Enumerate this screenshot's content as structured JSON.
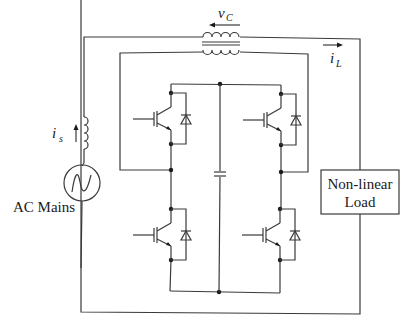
{
  "diagram": {
    "type": "circuit-schematic",
    "labels": {
      "voltage_transformer": "v",
      "voltage_transformer_sub": "C",
      "load_current": "i",
      "load_current_sub": "L",
      "source_current": "i",
      "source_current_sub": "s",
      "source": "AC Mains",
      "load_line1": "Non-linear",
      "load_line2": "Load"
    },
    "components": [
      {
        "id": "ac-source",
        "kind": "ac-voltage-source",
        "label": "AC Mains"
      },
      {
        "id": "source-inductor",
        "kind": "inductor",
        "current": "i_s"
      },
      {
        "id": "series-transformer",
        "kind": "transformer",
        "voltage": "v_C"
      },
      {
        "id": "igbt-upper-left",
        "kind": "igbt-with-antiparallel-diode"
      },
      {
        "id": "igbt-lower-left",
        "kind": "igbt-with-antiparallel-diode"
      },
      {
        "id": "igbt-upper-right",
        "kind": "igbt-with-antiparallel-diode"
      },
      {
        "id": "igbt-lower-right",
        "kind": "igbt-with-antiparallel-diode"
      },
      {
        "id": "dc-capacitor",
        "kind": "capacitor"
      },
      {
        "id": "nonlinear-load",
        "kind": "load-box",
        "label": "Non-linear Load",
        "current": "i_L"
      }
    ],
    "colors": {
      "wire": "#3a3a3a",
      "background": "#ffffff",
      "text": "#1a1a1a"
    }
  }
}
